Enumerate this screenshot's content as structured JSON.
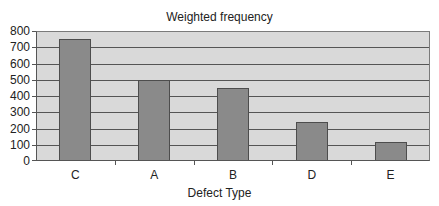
{
  "chart_data": {
    "type": "bar",
    "title": "Weighted frequency",
    "xlabel": "Defect Type",
    "ylabel": "",
    "categories": [
      "C",
      "A",
      "B",
      "D",
      "E"
    ],
    "values": [
      750,
      500,
      450,
      240,
      120
    ],
    "ylim": [
      0,
      800
    ],
    "yticks": [
      0,
      100,
      200,
      300,
      400,
      500,
      600,
      700,
      800
    ],
    "grid": true,
    "legend": null,
    "colors": {
      "bar": "#8a8a8a",
      "bar_border": "#4d4d4d",
      "plot_bg": "#d9d9d9",
      "gridline": "#555555"
    }
  }
}
